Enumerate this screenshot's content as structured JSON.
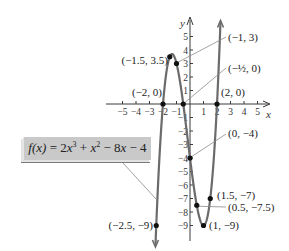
{
  "chart_data": {
    "type": "line",
    "title": "",
    "function_label": "f(x) = 2x^3 + x^2 - 8x - 4",
    "function_parts": {
      "lhs": "f(x)",
      "eq": " = 2",
      "t1": "x",
      "p1": "3",
      "plus": " + ",
      "t2": "x",
      "p2": "2",
      "rest1": " − 8",
      "t3": "x",
      "rest2": " − 4"
    },
    "xlabel": "x",
    "ylabel": "y",
    "xlim": [
      -5.5,
      5.5
    ],
    "ylim": [
      -9.8,
      6
    ],
    "x_ticks": [
      -5,
      -4,
      -3,
      -2,
      -1,
      1,
      2,
      3,
      4,
      5
    ],
    "x_tick_labels": [
      "−5",
      "−4",
      "−3",
      "−2",
      "−1",
      "1",
      "2",
      "3",
      "4",
      "5"
    ],
    "y_ticks": [
      5,
      4,
      3,
      2,
      1,
      -1,
      -2,
      -3,
      -4,
      -5,
      -6,
      -7,
      -8,
      -9
    ],
    "y_tick_labels": [
      "5",
      "4",
      "3",
      "2",
      "1",
      "−1",
      "−2",
      "−3",
      "−4",
      "−5",
      "−6",
      "−7",
      "−8",
      "−9"
    ],
    "grid": false,
    "curve_domain": [
      -2.56,
      2.26
    ],
    "points": [
      {
        "x": -2.5,
        "y": -9,
        "label": "(−2.5, −9)"
      },
      {
        "x": -2,
        "y": 0,
        "label": "(−2, 0)"
      },
      {
        "x": -1.5,
        "y": 3.5,
        "label": "(−1.5, 3.5)"
      },
      {
        "x": -1,
        "y": 3,
        "label": "(−1, 3)"
      },
      {
        "x": -0.5,
        "y": 0,
        "label": "(−½, 0)"
      },
      {
        "x": 0,
        "y": -4,
        "label": "(0, −4)"
      },
      {
        "x": 0.5,
        "y": -7.5,
        "label": "(0.5, −7.5)"
      },
      {
        "x": 1,
        "y": -9,
        "label": "(1, −9)"
      },
      {
        "x": 1.5,
        "y": -7,
        "label": "(1.5, −7)"
      },
      {
        "x": 2,
        "y": 0,
        "label": "(2, 0)"
      }
    ],
    "colors": {
      "curve": "#6b6b6b",
      "axis": "#3a3a3a",
      "point": "#111111",
      "leader": "#8a8a8a",
      "box": "#c9c9c9"
    }
  }
}
